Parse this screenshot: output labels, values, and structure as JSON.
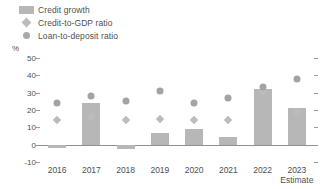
{
  "legend": {
    "items": [
      {
        "label": "Credit growth",
        "marker": "bar-swatch",
        "color": "#b7b7b7"
      },
      {
        "label": "Credit-to-GDP ratio",
        "marker": "diamond-marker",
        "color": "#bcbcbc"
      },
      {
        "label": "Loan-to-deposit ratio",
        "marker": "circle-marker",
        "color": "#a3a3a3"
      }
    ]
  },
  "axis": {
    "unit_label": "%",
    "yticks": [
      50,
      40,
      30,
      20,
      10,
      0,
      -10
    ]
  },
  "chart_data": {
    "type": "bar",
    "title": "",
    "subtitle": "",
    "xlabel": "",
    "ylabel": "%",
    "ylim": [
      -10,
      50
    ],
    "ytick_step": 10,
    "grid": false,
    "legend_position": "top-left",
    "categories": [
      "2016",
      "2017",
      "2018",
      "2019",
      "2020",
      "2021",
      "2022",
      "2023"
    ],
    "category_sublabels": [
      "",
      "",
      "",
      "",
      "",
      "",
      "",
      "Estimate"
    ],
    "series": [
      {
        "name": "Credit growth",
        "type": "bar",
        "color": "#b7b7b7",
        "values": [
          -2,
          24,
          -2.5,
          7,
          9,
          4.5,
          32,
          21
        ]
      },
      {
        "name": "Credit-to-GDP ratio",
        "type": "scatter",
        "marker": "diamond",
        "color": "#bcbcbc",
        "values": [
          14,
          16,
          14,
          15,
          14,
          14,
          31,
          19
        ]
      },
      {
        "name": "Loan-to-deposit ratio",
        "type": "scatter",
        "marker": "circle",
        "color": "#a3a3a3",
        "values": [
          24,
          28,
          25,
          31,
          24,
          27,
          33,
          38
        ]
      }
    ]
  }
}
